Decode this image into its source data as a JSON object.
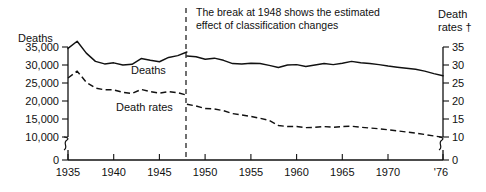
{
  "chart_data": {
    "type": "line",
    "title": "",
    "annotation": "The break at 1948 shows the estimated effect of classification changes",
    "annotation_line1": "The break at 1948 shows the estimated",
    "annotation_line2": "effect of classification changes",
    "xlabel": "",
    "ylabel_left": "Deaths",
    "ylabel_right_line1": "Death",
    "ylabel_right_line2": "rates †",
    "grid": false,
    "legend_position": "inline",
    "axis_break_left": true,
    "axis_break_right": true,
    "axis_break_x": true,
    "break_year": 1948,
    "xlim": [
      1935,
      1976
    ],
    "x_ticks": [
      1935,
      1940,
      1945,
      1950,
      1955,
      1960,
      1965,
      1970,
      1976
    ],
    "x_tick_labels": [
      "1935",
      "1940",
      "1945",
      "1950",
      "1955",
      "1960",
      "1965",
      "1970",
      "'76"
    ],
    "ylim_left": [
      0,
      35000
    ],
    "y_ticks_left": [
      0,
      10000,
      15000,
      20000,
      25000,
      30000,
      35000
    ],
    "y_tick_labels_left": [
      "0",
      "10,000",
      "15,000",
      "20,000",
      "25,000",
      "30,000",
      "35,000"
    ],
    "ylim_right": [
      0,
      35
    ],
    "y_ticks_right": [
      0,
      10,
      15,
      20,
      25,
      30,
      35
    ],
    "y_tick_labels_right": [
      "0",
      "10",
      "15",
      "20",
      "25",
      "30",
      "35"
    ],
    "series": [
      {
        "name": "Deaths",
        "inline_label": "Deaths",
        "axis": "left",
        "style": "solid",
        "segments": [
          {
            "period": "1935-1948",
            "x": [
              1935,
              1936,
              1937,
              1938,
              1939,
              1940,
              1941,
              1942,
              1943,
              1944,
              1945,
              1946,
              1947,
              1948
            ],
            "values": [
              34600,
              36600,
              33300,
              31000,
              30300,
              30600,
              30000,
              30200,
              31800,
              31300,
              30900,
              32100,
              32600,
              33600
            ]
          },
          {
            "period": "1948-1976",
            "x": [
              1948,
              1949,
              1950,
              1951,
              1952,
              1953,
              1954,
              1955,
              1956,
              1957,
              1958,
              1959,
              1960,
              1961,
              1962,
              1963,
              1964,
              1965,
              1966,
              1967,
              1968,
              1969,
              1970,
              1971,
              1972,
              1973,
              1974,
              1975,
              1976
            ],
            "values": [
              32500,
              32300,
              31600,
              31900,
              31300,
              30400,
              30300,
              30500,
              30400,
              29900,
              29300,
              30000,
              30100,
              29600,
              30000,
              30400,
              30100,
              30500,
              31000,
              30600,
              30400,
              30100,
              29700,
              29400,
              29100,
              28800,
              28300,
              27600,
              27000
            ]
          }
        ]
      },
      {
        "name": "Death rates",
        "inline_label": "Death rates",
        "axis": "right",
        "style": "dashed",
        "segments": [
          {
            "period": "1935-1948",
            "x": [
              1935,
              1936,
              1937,
              1938,
              1939,
              1940,
              1941,
              1942,
              1943,
              1944,
              1945,
              1946,
              1947,
              1948
            ],
            "values": [
              26.4,
              28.3,
              25.2,
              23.6,
              23.1,
              23.1,
              22.4,
              22.1,
              23.2,
              22.6,
              22.2,
              22.6,
              22.3,
              21.6
            ]
          },
          {
            "period": "1948-1976",
            "x": [
              1948,
              1949,
              1950,
              1951,
              1952,
              1953,
              1954,
              1955,
              1956,
              1957,
              1958,
              1959,
              1960,
              1961,
              1962,
              1963,
              1964,
              1965,
              1966,
              1967,
              1968,
              1969,
              1970,
              1971,
              1972,
              1973,
              1974,
              1975,
              1976
            ],
            "values": [
              19.1,
              18.6,
              17.9,
              17.8,
              17.3,
              16.5,
              16.1,
              15.7,
              15.2,
              14.6,
              13.2,
              12.9,
              12.9,
              12.6,
              12.7,
              12.9,
              12.7,
              12.9,
              13.0,
              12.7,
              12.5,
              12.3,
              12.0,
              11.7,
              11.4,
              11.1,
              10.7,
              10.3,
              9.9
            ]
          }
        ]
      }
    ]
  },
  "chart": {
    "series_label_deaths": "Deaths",
    "series_label_death_rates": "Death rates"
  }
}
